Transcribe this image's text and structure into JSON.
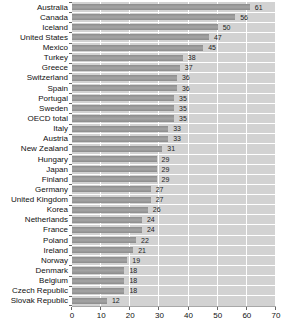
{
  "chart_data": {
    "type": "bar",
    "orientation": "horizontal",
    "title": "",
    "xlabel": "",
    "ylabel": "",
    "categories": [
      "Australia",
      "Canada",
      "Iceland",
      "United States",
      "Mexico",
      "Turkey",
      "Greece",
      "Switzerland",
      "Spain",
      "Portugal",
      "Sweden",
      "OECD total",
      "Italy",
      "Austria",
      "New Zealand",
      "Hungary",
      "Japan",
      "Finland",
      "Germany",
      "United Kingdom",
      "Korea",
      "Netherlands",
      "France",
      "Poland",
      "Ireland",
      "Norway",
      "Denmark",
      "Belgium",
      "Czech Republic",
      "Slovak Republic"
    ],
    "values": [
      61,
      56,
      50,
      47,
      45,
      38,
      37,
      36,
      36,
      35,
      35,
      35,
      33,
      33,
      31,
      29,
      29,
      29,
      27,
      27,
      26,
      24,
      24,
      22,
      21,
      19,
      18,
      18,
      18,
      12
    ],
    "value_labels_shown": true,
    "xlim": [
      0,
      70
    ],
    "xticks": [
      0,
      10,
      20,
      30,
      40,
      50,
      60,
      70
    ],
    "grid": "vertical-only",
    "legend": "none",
    "colors": {
      "bar": "#8c8c8c",
      "bar_highlight": "#a4a4a4",
      "plot_background": "#d2d2d2",
      "gridline": "#ffffff",
      "row_separator": "#ffffff",
      "axis_text": "#111111",
      "value_text": "#222222"
    }
  }
}
